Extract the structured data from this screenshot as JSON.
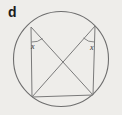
{
  "figure": {
    "part_label": "d",
    "type": "circle-geometry-diagram",
    "background_color": "#eeedea",
    "stroke_color": "#6e6e6e",
    "label_color": "#1b1b1b",
    "circle": {
      "cx": 61,
      "cy": 59,
      "r": 47.5
    },
    "vertices": {
      "top_left": {
        "x": 31,
        "y": 27
      },
      "top_right": {
        "x": 95,
        "y": 26
      },
      "bottom_left": {
        "x": 32,
        "y": 97
      },
      "bottom_right": {
        "x": 93,
        "y": 95
      }
    },
    "chords": [
      {
        "name": "left-side",
        "from": "top_left",
        "to": "bottom_left"
      },
      {
        "name": "right-side",
        "from": "top_right",
        "to": "bottom_right"
      },
      {
        "name": "bottom-side",
        "from": "bottom_left",
        "to": "bottom_right"
      },
      {
        "name": "diagonal-tl-br",
        "from": "top_left",
        "to": "bottom_right"
      },
      {
        "name": "diagonal-tr-bl",
        "from": "top_right",
        "to": "bottom_left"
      }
    ],
    "angles": [
      {
        "name": "angle-top-left",
        "label": "x",
        "vertex": "top_left"
      },
      {
        "name": "angle-top-right",
        "label": "x",
        "vertex": "top_right"
      }
    ]
  }
}
